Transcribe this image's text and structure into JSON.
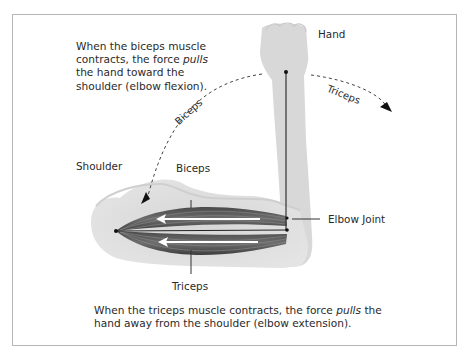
{
  "diagram": {
    "top_caption": {
      "line1": "When the biceps muscle",
      "line2_pre": "contracts, the force ",
      "line2_em": "pulls",
      "line3": "the hand toward the",
      "line4": "shoulder (elbow flexion)."
    },
    "bottom_caption": {
      "line1_pre": "When the triceps muscle contracts, the force ",
      "line1_em": "pulls",
      "line1_post": " the",
      "line2": "hand away from the shoulder (elbow extension)."
    },
    "labels": {
      "hand": "Hand",
      "shoulder": "Shoulder",
      "biceps": "Biceps",
      "triceps": "Triceps",
      "elbow_joint": "Elbow Joint"
    },
    "arc_labels": {
      "biceps": "Biceps",
      "triceps": "Triceps"
    },
    "colors": {
      "arm": "#d9d9d9",
      "muscle_dark": "#3a3a3a",
      "muscle_mid": "#6b6b6b",
      "arrow": "#ffffff",
      "frame": "#b5b5b5",
      "text": "#2a2a2a"
    }
  }
}
